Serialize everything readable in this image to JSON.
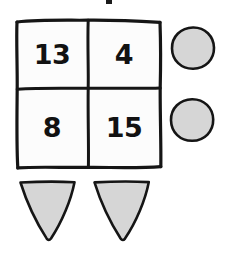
{
  "canvas": {
    "width": 231,
    "height": 253,
    "background_color": "#ffffff",
    "style": "hand-drawn-sketch"
  },
  "palette": {
    "ink": "#151515",
    "shape_gray": "#d6d6d6",
    "cell_white": "#fcfcfc",
    "number_black": "#121212"
  },
  "grid": {
    "name": "2x2 number grid",
    "rows": 2,
    "columns": 2,
    "cells": [
      {
        "row": 0,
        "col": 0,
        "value": "13"
      },
      {
        "row": 0,
        "col": 1,
        "value": "4"
      },
      {
        "row": 1,
        "col": 0,
        "value": "8"
      },
      {
        "row": 1,
        "col": 1,
        "value": "15"
      }
    ]
  },
  "circles": [
    {
      "index": 0,
      "label": "circle-top",
      "cx": 193,
      "cy": 48,
      "r": 21,
      "fill": "#d6d6d6"
    },
    {
      "index": 1,
      "label": "circle-bottom",
      "cx": 192,
      "cy": 120,
      "r": 21,
      "fill": "#d6d6d6"
    }
  ],
  "triangles": [
    {
      "index": 0,
      "label": "triangle-left",
      "orientation": "pointing-down",
      "fill": "#d6d6d6"
    },
    {
      "index": 1,
      "label": "triangle-right",
      "orientation": "pointing-down",
      "fill": "#d6d6d6"
    }
  ],
  "marks": [
    {
      "label": "top-speck",
      "x": 108,
      "y": 0,
      "width": 5,
      "height": 4
    }
  ]
}
